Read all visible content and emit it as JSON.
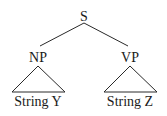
{
  "tree": {
    "root": {
      "label": "S"
    },
    "left": {
      "label": "NP",
      "leaf": "String Y"
    },
    "right": {
      "label": "VP",
      "leaf": "String Z"
    }
  },
  "colors": {
    "line": "#2a2a2a",
    "text": "#1a1a1a"
  }
}
